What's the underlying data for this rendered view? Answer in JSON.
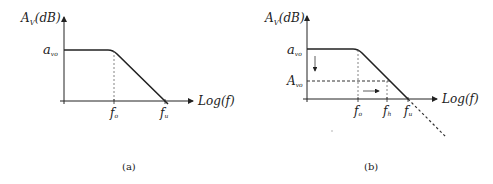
{
  "panels": [
    {
      "id": "a",
      "caption": "(a)",
      "y_axis_label_main": "A",
      "y_axis_label_sub": "V",
      "y_axis_label_unit": "(dB)",
      "x_axis_label": "Log(f)",
      "plateau_label_main": "a",
      "plateau_label_sub": "vo",
      "tick_labels": [
        {
          "main": "f",
          "sub": "o"
        },
        {
          "main": "f",
          "sub": "u"
        }
      ]
    },
    {
      "id": "b",
      "caption": "(b)",
      "y_axis_label_main": "A",
      "y_axis_label_sub": "V",
      "y_axis_label_unit": "(dB)",
      "x_axis_label": "Log(f)",
      "plateau_label_main": "a",
      "plateau_label_sub": "vo",
      "reduced_gain_label_main": "A",
      "reduced_gain_label_sub": "vo",
      "tick_labels": [
        {
          "main": "f",
          "sub": "o"
        },
        {
          "main": "f",
          "sub": "h"
        },
        {
          "main": "f",
          "sub": "u"
        }
      ]
    }
  ],
  "colors": {
    "line": "#222222",
    "dashed": "#555555"
  }
}
